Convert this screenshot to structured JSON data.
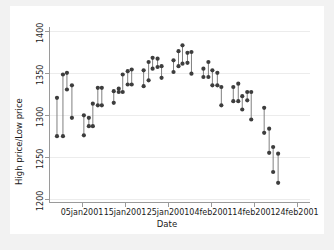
{
  "chart_data": {
    "type": "scatter",
    "title": "",
    "xlabel": "Date",
    "ylabel": "High price/Low price",
    "ylim": [
      1195,
      1405
    ],
    "yticks": [
      1200,
      1250,
      1300,
      1350,
      1400
    ],
    "ytick_labels": [
      "1200",
      "1250",
      "1300",
      "1350",
      "1400"
    ],
    "xticks": [
      "05jan2001",
      "15jan2001",
      "25jan2001",
      "04feb2001",
      "14feb2001",
      "24feb2001"
    ],
    "xtick_positions": [
      82,
      125,
      168,
      211,
      254,
      297
    ],
    "grid": "horizontal",
    "legend": "none",
    "marker_color": "#3d3d3d",
    "line_color": "#7f7f7f",
    "background_color": "#ffffff",
    "figure_background": "#f2f2f2",
    "series": [
      {
        "name": "High price",
        "key": "high"
      },
      {
        "name": "Low price",
        "key": "low"
      }
    ],
    "points": [
      {
        "x": 56,
        "high": 1320,
        "low": 1274
      },
      {
        "x": 62,
        "high": 1348,
        "low": 1274
      },
      {
        "x": 66,
        "high": 1350,
        "low": 1330
      },
      {
        "x": 71,
        "high": 1335,
        "low": 1296
      },
      {
        "x": 83,
        "high": 1299,
        "low": 1275
      },
      {
        "x": 88,
        "high": 1296,
        "low": 1286
      },
      {
        "x": 92,
        "high": 1313,
        "low": 1286
      },
      {
        "x": 97,
        "high": 1332,
        "low": 1311
      },
      {
        "x": 101,
        "high": 1332,
        "low": 1311
      },
      {
        "x": 113,
        "high": 1328,
        "low": 1314
      },
      {
        "x": 118,
        "high": 1331,
        "low": 1327
      },
      {
        "x": 122,
        "high": 1348,
        "low": 1327
      },
      {
        "x": 127,
        "high": 1352,
        "low": 1336
      },
      {
        "x": 131,
        "high": 1354,
        "low": 1336
      },
      {
        "x": 143,
        "high": 1353,
        "low": 1334
      },
      {
        "x": 148,
        "high": 1363,
        "low": 1341
      },
      {
        "x": 152,
        "high": 1368,
        "low": 1355
      },
      {
        "x": 157,
        "high": 1367,
        "low": 1357
      },
      {
        "x": 161,
        "high": 1358,
        "low": 1344
      },
      {
        "x": 173,
        "high": 1365,
        "low": 1351
      },
      {
        "x": 178,
        "high": 1376,
        "low": 1358
      },
      {
        "x": 182,
        "high": 1383,
        "low": 1361
      },
      {
        "x": 187,
        "high": 1374,
        "low": 1362
      },
      {
        "x": 191,
        "high": 1375,
        "low": 1349
      },
      {
        "x": 203,
        "high": 1355,
        "low": 1345
      },
      {
        "x": 208,
        "high": 1363,
        "low": 1345
      },
      {
        "x": 212,
        "high": 1353,
        "low": 1335
      },
      {
        "x": 217,
        "high": 1350,
        "low": 1335
      },
      {
        "x": 221,
        "high": 1333,
        "low": 1311
      },
      {
        "x": 233,
        "high": 1333,
        "low": 1316
      },
      {
        "x": 238,
        "high": 1337,
        "low": 1316
      },
      {
        "x": 242,
        "high": 1322,
        "low": 1306
      },
      {
        "x": 247,
        "high": 1327,
        "low": 1317
      },
      {
        "x": 251,
        "high": 1327,
        "low": 1294
      },
      {
        "x": 264,
        "high": 1308,
        "low": 1278
      },
      {
        "x": 269,
        "high": 1283,
        "low": 1254
      },
      {
        "x": 273,
        "high": 1261,
        "low": 1231
      },
      {
        "x": 278,
        "high": 1253,
        "low": 1218
      }
    ]
  },
  "axes": {
    "y_title": "High price/Low price",
    "x_title": "Date"
  }
}
